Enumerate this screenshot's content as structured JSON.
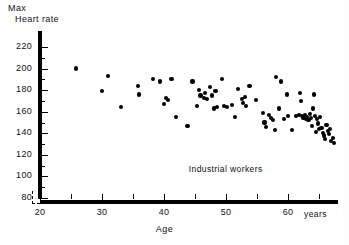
{
  "chart_data": {
    "type": "scatter",
    "title": "",
    "ylabel_lines": [
      "Max",
      "Heart rate"
    ],
    "xlabel": "Age",
    "x_units": "years",
    "annotation": "Industrial workers",
    "annotation_at": [
      44,
      107
    ],
    "xlim": [
      19,
      68
    ],
    "ylim": [
      78,
      228
    ],
    "grid": false,
    "legend": "none",
    "xticks_major": [
      20,
      30,
      40,
      50,
      60
    ],
    "xticks_minor": [
      25,
      35,
      45,
      55,
      65
    ],
    "yticks_major": [
      80,
      100,
      120,
      140,
      160,
      180,
      200,
      220
    ],
    "yticks_minor": [
      90,
      110,
      130,
      150,
      170,
      190,
      210
    ],
    "xtick_labels": [
      "20",
      "30",
      "40",
      "50",
      "60"
    ],
    "ytick_labels": [
      "80",
      "100",
      "120",
      "140",
      "160",
      "180",
      "200",
      "220"
    ],
    "marker": "filled-circle",
    "marker_color": "#000000",
    "axis_color": "#000000",
    "background": "#ffffff",
    "n_points": 85,
    "points": [
      [
        20.0,
        209
      ],
      [
        25.8,
        200
      ],
      [
        30.0,
        179
      ],
      [
        31.0,
        193
      ],
      [
        33.0,
        164
      ],
      [
        35.8,
        184
      ],
      [
        36.0,
        176
      ],
      [
        38.2,
        190
      ],
      [
        39.3,
        188
      ],
      [
        40.0,
        167
      ],
      [
        40.3,
        173
      ],
      [
        40.6,
        171
      ],
      [
        41.2,
        190
      ],
      [
        42.0,
        155
      ],
      [
        43.8,
        147
      ],
      [
        44.6,
        188
      ],
      [
        45.3,
        165
      ],
      [
        45.6,
        180
      ],
      [
        45.9,
        175
      ],
      [
        46.4,
        173
      ],
      [
        46.6,
        177
      ],
      [
        46.9,
        172
      ],
      [
        47.4,
        183
      ],
      [
        47.8,
        175
      ],
      [
        48.0,
        163
      ],
      [
        48.3,
        179
      ],
      [
        48.6,
        164
      ],
      [
        49.3,
        190
      ],
      [
        49.7,
        165
      ],
      [
        50.1,
        164
      ],
      [
        51.5,
        155
      ],
      [
        52.0,
        181
      ],
      [
        52.6,
        172
      ],
      [
        52.8,
        168
      ],
      [
        53.0,
        174
      ],
      [
        53.2,
        165
      ],
      [
        53.8,
        184
      ],
      [
        54.9,
        171
      ],
      [
        56.0,
        159
      ],
      [
        56.2,
        150
      ],
      [
        56.5,
        146
      ],
      [
        57.0,
        157
      ],
      [
        57.3,
        154
      ],
      [
        57.6,
        152
      ],
      [
        57.9,
        143
      ],
      [
        58.0,
        192
      ],
      [
        58.6,
        163
      ],
      [
        58.9,
        188
      ],
      [
        59.4,
        153
      ],
      [
        60.0,
        156
      ],
      [
        60.6,
        143
      ],
      [
        61.3,
        156
      ],
      [
        61.8,
        157
      ],
      [
        62.0,
        177
      ],
      [
        62.1,
        170
      ],
      [
        62.3,
        156
      ],
      [
        62.5,
        154
      ],
      [
        62.7,
        157
      ],
      [
        62.9,
        153
      ],
      [
        63.1,
        155
      ],
      [
        63.3,
        152
      ],
      [
        63.5,
        158
      ],
      [
        63.7,
        154
      ],
      [
        63.9,
        147
      ],
      [
        64.0,
        163
      ],
      [
        64.2,
        176
      ],
      [
        64.4,
        156
      ],
      [
        64.5,
        141
      ],
      [
        64.7,
        153
      ],
      [
        64.9,
        149
      ],
      [
        65.0,
        144
      ],
      [
        65.2,
        155
      ],
      [
        65.4,
        145
      ],
      [
        65.6,
        140
      ],
      [
        65.8,
        138
      ],
      [
        66.0,
        135
      ],
      [
        66.2,
        148
      ],
      [
        66.4,
        142
      ],
      [
        66.6,
        139
      ],
      [
        66.8,
        144
      ],
      [
        67.0,
        133
      ],
      [
        67.2,
        136
      ],
      [
        67.4,
        131
      ],
      [
        59.8,
        176
      ],
      [
        51.0,
        166
      ]
    ]
  }
}
